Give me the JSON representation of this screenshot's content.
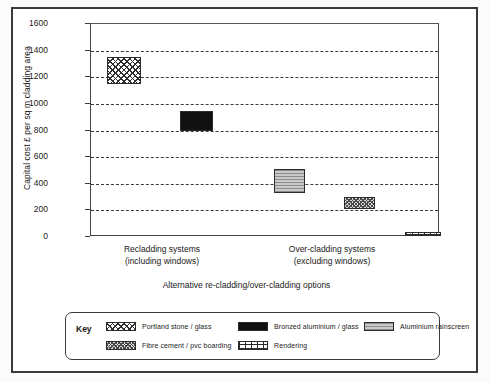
{
  "chart_data": {
    "type": "bar",
    "title": "",
    "xlabel": "Alternative re-cladding/over-cladding options",
    "ylabel": "Capital cost £ per sq m cladding area",
    "ylim": [
      0,
      1600
    ],
    "yticks": [
      0,
      200,
      400,
      600,
      800,
      1000,
      1200,
      1400,
      1600
    ],
    "grid": true,
    "grid_style": "dashed horizontal",
    "categories": [
      "Recladding systems (including windows)",
      "Over-cladding systems (excluding windows)"
    ],
    "category_labels": [
      {
        "line1": "Recladding systems",
        "line2": "(including windows)"
      },
      {
        "line1": "Over-cladding systems",
        "line2": "(excluding windows)"
      }
    ],
    "note": "Each bar is drawn as a floating range block (low to high cost band)",
    "bars": [
      {
        "name": "Portland stone / glass",
        "group": "Recladding systems (including windows)",
        "low": 1150,
        "high": 1350,
        "pattern": "diamond-crosshatch",
        "color": "#ffffff"
      },
      {
        "name": "Bronzed aluminium / glass",
        "group": "Recladding systems (including windows)",
        "low": 800,
        "high": 950,
        "pattern": "solid-black",
        "color": "#111111"
      },
      {
        "name": "Aluminium rainscreen",
        "group": "Over-cladding systems (excluding windows)",
        "low": 330,
        "high": 510,
        "pattern": "horizontal-lines",
        "color": "#c9c9c9"
      },
      {
        "name": "Fibre cement / pvc boarding",
        "group": "Over-cladding systems (excluding windows)",
        "low": 210,
        "high": 300,
        "pattern": "fine-crosshatch",
        "color": "#d8d8d8"
      },
      {
        "name": "Rendering",
        "group": "Over-cladding systems (excluding windows)",
        "low": 10,
        "high": 40,
        "pattern": "brick",
        "color": "#ffffff"
      }
    ]
  },
  "legend": {
    "title": "Key",
    "items": [
      {
        "label": "Portland stone / glass",
        "pattern": "diamond-crosshatch"
      },
      {
        "label": "Bronzed aluminium / glass",
        "pattern": "solid-black"
      },
      {
        "label": "Aluminium rainscreen",
        "pattern": "horizontal-lines"
      },
      {
        "label": "Fibre cement / pvc boarding",
        "pattern": "fine-crosshatch"
      },
      {
        "label": "Rendering",
        "pattern": "brick"
      }
    ]
  },
  "axis": {
    "ytick_labels": [
      "1600",
      "1400",
      "1200",
      "1000",
      "800",
      "600",
      "400",
      "200",
      "0"
    ]
  }
}
